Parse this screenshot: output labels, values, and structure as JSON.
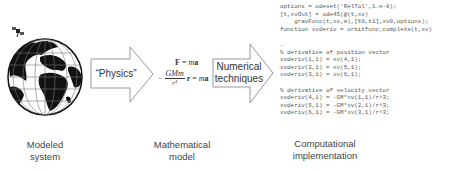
{
  "stages": [
    {
      "id": "modeled-system",
      "caption_line1": "Modeled",
      "caption_line2": "system"
    },
    {
      "id": "mathematical-model",
      "caption_line1": "Mathematical",
      "caption_line2": "model"
    },
    {
      "id": "computational-implementation",
      "caption_line1": "Computational",
      "caption_line2": "implementation"
    }
  ],
  "arrows": [
    {
      "label_line1": "“Physics”",
      "label_line2": ""
    },
    {
      "label_line1": "Numerical",
      "label_line2": "techniques"
    }
  ],
  "equations": {
    "newton": "F = ma",
    "gravity_numerator": "GMm",
    "gravity_denominator": "r³",
    "gravity_minus": "−",
    "gravity_rhs": "r = ma"
  },
  "icons": {
    "globe": "earth-globe-icon",
    "satellite": "satellite-icon"
  },
  "code_lines": [
    "options = odeset('RelTol',1.e-8);",
    "[t,xvOut] = ode45(@(t,xv)",
    "    gravFunc(t,xv,m),[t0,t1],xv0,options);",
    "function xvderiv = orbitfunc_complete(t,xv)",
    "",
    "…",
    "% derivative of position vector",
    "xvderiv(1,1) = xv(4,1);",
    "xvderiv(2,1) = xv(5,1);",
    "xvderiv(3,1) = xv(6,1);",
    "",
    "% derivative of velocity vector",
    "xvderiv(4,1) = -GM*xv(1,1)/r^3;",
    "xvderiv(5,1) = -GM*xv(2,1)/r^3;",
    "xvderiv(6,1) = -GM*xv(3,1)/r^3;"
  ]
}
